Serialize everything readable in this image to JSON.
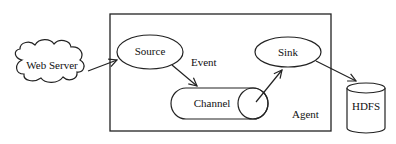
{
  "diagram": {
    "title": "",
    "nodes": {
      "web_server": {
        "label": "Web Server",
        "shape": "cloud"
      },
      "source": {
        "label": "Source",
        "shape": "ellipse"
      },
      "channel": {
        "label": "Channel",
        "shape": "horizontal-cylinder"
      },
      "sink": {
        "label": "Sink",
        "shape": "ellipse"
      },
      "hdfs": {
        "label": "HDFS",
        "shape": "cylinder"
      },
      "agent": {
        "label": "Agent",
        "shape": "rectangle-container"
      }
    },
    "edges": [
      {
        "from": "Web Server",
        "to": "Source",
        "label": ""
      },
      {
        "from": "Source",
        "to": "Channel",
        "label": "Event"
      },
      {
        "from": "Channel",
        "to": "Sink",
        "label": ""
      },
      {
        "from": "Sink",
        "to": "HDFS",
        "label": ""
      }
    ],
    "edge_labels": {
      "event": "Event"
    },
    "colors": {
      "stroke": "#222222",
      "background": "#ffffff"
    }
  }
}
